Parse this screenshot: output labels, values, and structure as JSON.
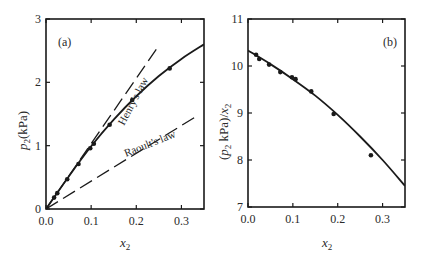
{
  "chart_data": [
    {
      "type": "line",
      "panel_label": "(a)",
      "title": "",
      "xlabel": "x2",
      "ylabel": "p2(kPa)",
      "xlim": [
        0.0,
        0.35
      ],
      "ylim": [
        0,
        3
      ],
      "x_ticks": [
        "0.0",
        "0.1",
        "0.2",
        "0.3"
      ],
      "y_ticks": [
        "0",
        "1",
        "2",
        "3"
      ],
      "grid": false,
      "series": [
        {
          "name": "experimental",
          "style": "points",
          "x": [
            0.018,
            0.025,
            0.047,
            0.072,
            0.098,
            0.106,
            0.141,
            0.191,
            0.274
          ],
          "y": [
            0.18,
            0.25,
            0.47,
            0.71,
            0.96,
            1.03,
            1.33,
            1.72,
            2.22
          ]
        },
        {
          "name": "fit curve",
          "style": "solid",
          "x": [
            0.0,
            0.05,
            0.1,
            0.15,
            0.2,
            0.25,
            0.3,
            0.35
          ],
          "y": [
            0.0,
            0.51,
            0.99,
            1.41,
            1.78,
            2.1,
            2.37,
            2.6
          ]
        },
        {
          "name": "Henry's law",
          "style": "dashed",
          "x": [
            0.0,
            0.25
          ],
          "y": [
            0.0,
            2.58
          ]
        },
        {
          "name": "Raoult's law",
          "style": "dashed",
          "x": [
            0.0,
            0.33
          ],
          "y": [
            0.0,
            1.45
          ]
        }
      ],
      "annotations": [
        "Henry's law",
        "Raoult's law"
      ]
    },
    {
      "type": "line",
      "panel_label": "(b)",
      "title": "",
      "xlabel": "x2",
      "ylabel": "(p2 kPa)/x2",
      "xlim": [
        0.0,
        0.35
      ],
      "ylim": [
        7,
        11
      ],
      "x_ticks": [
        "0.0",
        "0.1",
        "0.2",
        "0.3"
      ],
      "y_ticks": [
        "7",
        "8",
        "9",
        "10",
        "11"
      ],
      "grid": false,
      "series": [
        {
          "name": "experimental",
          "style": "points",
          "x": [
            0.018,
            0.025,
            0.047,
            0.072,
            0.098,
            0.106,
            0.141,
            0.191,
            0.274
          ],
          "y": [
            10.24,
            10.15,
            10.03,
            9.87,
            9.76,
            9.72,
            9.46,
            8.98,
            8.1
          ]
        },
        {
          "name": "fit curve",
          "style": "solid",
          "x": [
            0.0,
            0.05,
            0.1,
            0.15,
            0.2,
            0.25,
            0.3,
            0.35
          ],
          "y": [
            10.33,
            10.04,
            9.72,
            9.37,
            8.96,
            8.5,
            8.0,
            7.45
          ]
        }
      ]
    }
  ],
  "labels": {
    "a_panel": "(a)",
    "b_panel": "(b)",
    "henry": "Henry's law",
    "raoult": "Raoult's law",
    "xlabel_main": "x",
    "xlabel_sub": "2",
    "a_ylabel_p": "p",
    "a_ylabel_sub": "2",
    "a_ylabel_rest": "(kPa)",
    "b_ylabel_open": "(",
    "b_ylabel_p": "p",
    "b_ylabel_sub": "2",
    "b_ylabel_mid": " kPa)/",
    "b_ylabel_x": "x",
    "b_ylabel_sub2": "2"
  }
}
